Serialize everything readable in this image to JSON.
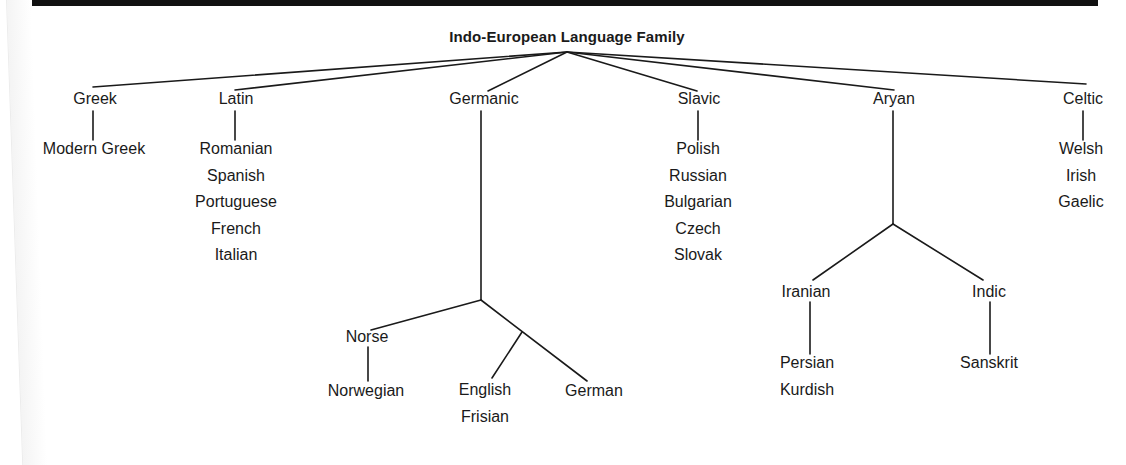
{
  "title": "Indo-European Language Family",
  "branches": {
    "greek": {
      "label": "Greek",
      "children": [
        "Modern Greek"
      ]
    },
    "latin": {
      "label": "Latin",
      "children": [
        "Romanian",
        "Spanish",
        "Portuguese",
        "French",
        "Italian"
      ]
    },
    "germanic": {
      "label": "Germanic",
      "norse": {
        "label": "Norse",
        "children": [
          "Norwegian"
        ]
      },
      "west": {
        "english": [
          "English",
          "Frisian"
        ],
        "german": "German"
      }
    },
    "slavic": {
      "label": "Slavic",
      "children": [
        "Polish",
        "Russian",
        "Bulgarian",
        "Czech",
        "Slovak"
      ]
    },
    "aryan": {
      "label": "Aryan",
      "iranian": {
        "label": "Iranian",
        "children": [
          "Persian",
          "Kurdish"
        ]
      },
      "indic": {
        "label": "Indic",
        "children": [
          "Sanskrit"
        ]
      }
    },
    "celtic": {
      "label": "Celtic",
      "children": [
        "Welsh",
        "Irish",
        "Gaelic"
      ]
    }
  },
  "colors": {
    "ink": "#1a1a1a",
    "paper": "#ffffff",
    "rule": "#111111"
  }
}
